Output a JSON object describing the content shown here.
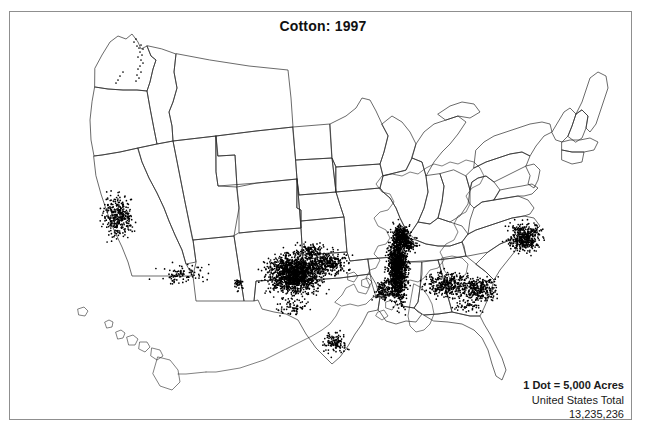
{
  "title": "Cotton:  1997",
  "legend": {
    "dot_value": "1 Dot = 5,000 Acres",
    "total_label": "United States Total",
    "total_value": "13,235,236"
  },
  "chart_data": {
    "type": "scatter",
    "title": "Cotton:  1997",
    "subtype": "dot-density-map",
    "region": "United States",
    "dot_unit_acres": 5000,
    "national_total_acres": 13235236,
    "xlabel": "",
    "ylabel": "",
    "grid": false,
    "legend_position": "bottom-right",
    "clusters": [
      {
        "name": "West Texas High Plains",
        "cx": 285,
        "cy": 262,
        "rx": 30,
        "ry": 22,
        "dots": 1500,
        "density": "very-high"
      },
      {
        "name": "Texas Rolling Plains",
        "cx": 318,
        "cy": 252,
        "rx": 22,
        "ry": 14,
        "dots": 300,
        "density": "medium"
      },
      {
        "name": "Mississippi Delta",
        "cx": 388,
        "cy": 255,
        "rx": 11,
        "ry": 38,
        "dots": 1300,
        "density": "very-high"
      },
      {
        "name": "Missouri Bootheel",
        "cx": 392,
        "cy": 222,
        "rx": 9,
        "ry": 10,
        "dots": 220,
        "density": "high"
      },
      {
        "name": "Alabama Black Belt",
        "cx": 437,
        "cy": 272,
        "rx": 24,
        "ry": 14,
        "dots": 330,
        "density": "medium"
      },
      {
        "name": "Georgia Coastal Plain",
        "cx": 468,
        "cy": 278,
        "rx": 22,
        "ry": 14,
        "dots": 300,
        "density": "medium"
      },
      {
        "name": "Carolinas Coastal Plain",
        "cx": 515,
        "cy": 226,
        "rx": 18,
        "ry": 16,
        "dots": 420,
        "density": "high"
      },
      {
        "name": "San Joaquin Valley California",
        "cx": 108,
        "cy": 205,
        "rx": 16,
        "ry": 24,
        "dots": 330,
        "density": "high"
      },
      {
        "name": "Arizona Desert Valleys",
        "cx": 172,
        "cy": 262,
        "rx": 26,
        "ry": 11,
        "dots": 90,
        "density": "low"
      },
      {
        "name": "South Texas Coastal Bend",
        "cx": 325,
        "cy": 330,
        "rx": 14,
        "ry": 12,
        "dots": 120,
        "density": "medium"
      },
      {
        "name": "Texas Upper Gulf Coast",
        "cx": 282,
        "cy": 295,
        "rx": 20,
        "ry": 10,
        "dots": 70,
        "density": "low"
      },
      {
        "name": "Tennessee West",
        "cx": 398,
        "cy": 232,
        "rx": 10,
        "ry": 9,
        "dots": 140,
        "density": "medium"
      },
      {
        "name": "Oklahoma Southwest",
        "cx": 300,
        "cy": 238,
        "rx": 16,
        "ry": 9,
        "dots": 110,
        "density": "low"
      },
      {
        "name": "New Mexico Mesilla Valley",
        "cx": 228,
        "cy": 272,
        "rx": 6,
        "ry": 7,
        "dots": 35,
        "density": "low"
      },
      {
        "name": "Louisiana North",
        "cx": 375,
        "cy": 278,
        "rx": 12,
        "ry": 12,
        "dots": 130,
        "density": "medium"
      },
      {
        "name": "North Florida Panhandle",
        "cx": 459,
        "cy": 295,
        "rx": 14,
        "ry": 7,
        "dots": 40,
        "density": "low"
      }
    ]
  }
}
